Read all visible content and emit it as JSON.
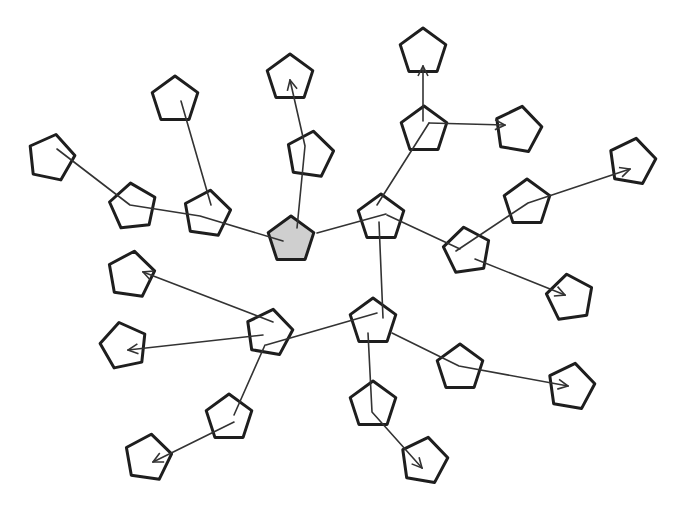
{
  "diagram": {
    "type": "tree-network",
    "node_shape": "pentagon",
    "node_radius": 24,
    "colors": {
      "background": "#ffffff",
      "node_fill": "none",
      "root_fill": "#cfcfcf",
      "stroke": "#1e1e1e",
      "edge": "#333333"
    },
    "nodes": [
      {
        "id": "n0",
        "x": 291,
        "y": 240,
        "rot": 0,
        "root": true
      },
      {
        "id": "n1",
        "x": 381,
        "y": 218,
        "rot": 0
      },
      {
        "id": "n2",
        "x": 207,
        "y": 214,
        "rot": 8
      },
      {
        "id": "n3",
        "x": 133,
        "y": 207,
        "rot": -6
      },
      {
        "id": "n4",
        "x": 51,
        "y": 158,
        "rot": 12
      },
      {
        "id": "n5",
        "x": 175,
        "y": 100,
        "rot": 0
      },
      {
        "id": "n6",
        "x": 290,
        "y": 78,
        "rot": 0
      },
      {
        "id": "n7",
        "x": 310,
        "y": 155,
        "rot": 8
      },
      {
        "id": "n8",
        "x": 424,
        "y": 130,
        "rot": 0
      },
      {
        "id": "n9",
        "x": 423,
        "y": 52,
        "rot": 0
      },
      {
        "id": "n10",
        "x": 518,
        "y": 130,
        "rot": 10
      },
      {
        "id": "n11",
        "x": 527,
        "y": 203,
        "rot": 0
      },
      {
        "id": "n12",
        "x": 632,
        "y": 162,
        "rot": 10
      },
      {
        "id": "n13",
        "x": 467,
        "y": 251,
        "rot": -8
      },
      {
        "id": "n14",
        "x": 570,
        "y": 298,
        "rot": -8
      },
      {
        "id": "n15",
        "x": 131,
        "y": 275,
        "rot": 8
      },
      {
        "id": "n16",
        "x": 269,
        "y": 333,
        "rot": 10
      },
      {
        "id": "n17",
        "x": 373,
        "y": 322,
        "rot": 0
      },
      {
        "id": "n18",
        "x": 124,
        "y": 346,
        "rot": -12
      },
      {
        "id": "n19",
        "x": 229,
        "y": 418,
        "rot": 0
      },
      {
        "id": "n20",
        "x": 148,
        "y": 458,
        "rot": 8
      },
      {
        "id": "n21",
        "x": 460,
        "y": 368,
        "rot": 0
      },
      {
        "id": "n22",
        "x": 571,
        "y": 387,
        "rot": 10
      },
      {
        "id": "n23",
        "x": 373,
        "y": 405,
        "rot": 0
      },
      {
        "id": "n24",
        "x": 424,
        "y": 461,
        "rot": 10
      }
    ],
    "edges": [
      {
        "from": "n4",
        "to": "n0",
        "points": [
          [
            57,
            149
          ],
          [
            130,
            205
          ],
          [
            200,
            216
          ],
          [
            283,
            241
          ]
        ],
        "arrow": false
      },
      {
        "from": "n5",
        "to": "n2",
        "points": [
          [
            181,
            101
          ],
          [
            211,
            205
          ]
        ],
        "arrow": false
      },
      {
        "from": "n0",
        "to": "n6",
        "points": [
          [
            297,
            228
          ],
          [
            305,
            146
          ],
          [
            290,
            80
          ]
        ],
        "arrow": true
      },
      {
        "from": "n0",
        "to": "n1",
        "points": [
          [
            317,
            233
          ],
          [
            386,
            214
          ]
        ],
        "arrow": false
      },
      {
        "from": "n1",
        "to": "n8",
        "points": [
          [
            377,
            205
          ],
          [
            429,
            123
          ]
        ],
        "arrow": false
      },
      {
        "from": "n8",
        "to": "n9",
        "points": [
          [
            423,
            121
          ],
          [
            423,
            66
          ]
        ],
        "arrow": true
      },
      {
        "from": "n8",
        "to": "n10",
        "points": [
          [
            429,
            123
          ],
          [
            505,
            125
          ]
        ],
        "arrow": true
      },
      {
        "from": "n1",
        "to": "n13",
        "points": [
          [
            387,
            215
          ],
          [
            460,
            249
          ]
        ],
        "arrow": false
      },
      {
        "from": "n13",
        "to": "n12",
        "points": [
          [
            456,
            251
          ],
          [
            528,
            203
          ],
          [
            630,
            169
          ]
        ],
        "arrow": true
      },
      {
        "from": "n13",
        "to": "n14",
        "points": [
          [
            475,
            259
          ],
          [
            565,
            295
          ]
        ],
        "arrow": true
      },
      {
        "from": "n1",
        "to": "n17",
        "points": [
          [
            379,
            222
          ],
          [
            383,
            318
          ]
        ],
        "arrow": false
      },
      {
        "from": "n17",
        "to": "n16",
        "points": [
          [
            377,
            313
          ],
          [
            266,
            345
          ]
        ],
        "arrow": false
      },
      {
        "from": "n16",
        "to": "n15",
        "points": [
          [
            273,
            322
          ],
          [
            143,
            272
          ]
        ],
        "arrow": true
      },
      {
        "from": "n16",
        "to": "n18",
        "points": [
          [
            263,
            335
          ],
          [
            128,
            350
          ]
        ],
        "arrow": true
      },
      {
        "from": "n16",
        "to": "n19",
        "points": [
          [
            265,
            345
          ],
          [
            234,
            415
          ]
        ],
        "arrow": false
      },
      {
        "from": "n19",
        "to": "n20",
        "points": [
          [
            234,
            422
          ],
          [
            153,
            462
          ]
        ],
        "arrow": true
      },
      {
        "from": "n17",
        "to": "n22",
        "points": [
          [
            392,
            333
          ],
          [
            459,
            366
          ],
          [
            568,
            386
          ]
        ],
        "arrow": true
      },
      {
        "from": "n17",
        "to": "n24",
        "points": [
          [
            368,
            333
          ],
          [
            372,
            412
          ],
          [
            422,
            468
          ]
        ],
        "arrow": true
      }
    ]
  }
}
